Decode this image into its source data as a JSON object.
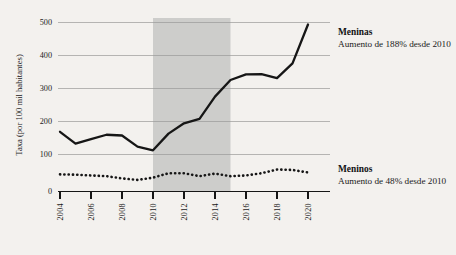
{
  "chart_data": {
    "type": "line",
    "title": "",
    "subtitle": "",
    "xlabel": "",
    "ylabel": "Taxa (por 100 mil habitantes)",
    "xlim": [
      2003.5,
      2020.5
    ],
    "ylim": [
      0,
      500
    ],
    "grid": true,
    "legend_position": "inline-right",
    "x": [
      2004,
      2005,
      2006,
      2007,
      2008,
      2009,
      2010,
      2011,
      2012,
      2013,
      2014,
      2015,
      2016,
      2017,
      2018,
      2019,
      2020
    ],
    "y_ticks": [
      "0",
      "100",
      "200",
      "300",
      "400",
      "500"
    ],
    "y_tick_values": [
      0,
      100,
      200,
      300,
      400,
      500
    ],
    "x_ticks": [
      "2004",
      "2006",
      "2008",
      "2010",
      "2012",
      "2014",
      "2016",
      "2018",
      "2020"
    ],
    "x_tick_values": [
      2004,
      2006,
      2008,
      2010,
      2012,
      2014,
      2016,
      2018,
      2020
    ],
    "series": [
      {
        "name": "Meninas",
        "style": "solid",
        "values": [
          160,
          128,
          140,
          152,
          150,
          120,
          110,
          155,
          183,
          195,
          255,
          300,
          315,
          316,
          305,
          345,
          450
        ]
      },
      {
        "name": "Meninos",
        "style": "dotted",
        "values": [
          45,
          44,
          42,
          40,
          34,
          30,
          36,
          48,
          48,
          40,
          47,
          40,
          42,
          48,
          58,
          57,
          50
        ]
      }
    ],
    "annotations": [
      {
        "id": "meninas",
        "title": "Meninas",
        "subtitle": "Aumento de 188% desde 2010"
      },
      {
        "id": "meninos",
        "title": "Meninos",
        "subtitle": "Aumento de 48% desde 2010"
      }
    ],
    "shaded_band": {
      "label": "",
      "x_start": 2010,
      "x_end": 2015,
      "color": "#cdcdcb"
    },
    "colors": {
      "background": "#f3f1ee",
      "line": "#161616",
      "grid": "#9a9a98",
      "band": "#cdcdcb"
    }
  }
}
